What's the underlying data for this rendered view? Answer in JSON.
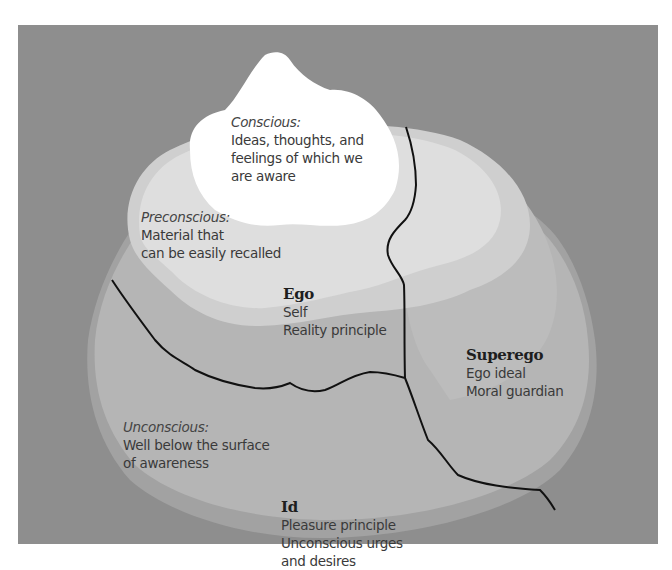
{
  "diagram": {
    "type": "iceberg model of the mind",
    "colors": {
      "background_frame": "#8e8e8e",
      "unconscious_region": "#b4b4b4",
      "unconscious_rim": "#a2a2a2",
      "preconscious_region": "#d6d6d6",
      "preconscious_inner": "#e2e2e2",
      "conscious_tip": "#ffffff",
      "divider_lines": "#111111",
      "text": "#3a3a3a"
    },
    "levels": {
      "conscious": {
        "title": "Conscious:",
        "lines": [
          "Ideas, thoughts, and",
          "feelings of which we",
          "are aware"
        ]
      },
      "preconscious": {
        "title": "Preconscious:",
        "lines": [
          "Material that",
          "can be easily recalled"
        ]
      },
      "unconscious": {
        "title": "Unconscious:",
        "lines": [
          "Well below the surface",
          "of awareness"
        ]
      }
    },
    "structures": {
      "ego": {
        "title": "Ego",
        "lines": [
          "Self",
          "Reality principle"
        ]
      },
      "superego": {
        "title": "Superego",
        "lines": [
          "Ego ideal",
          "Moral guardian"
        ]
      },
      "id": {
        "title": "Id",
        "lines": [
          "Pleasure principle",
          "Unconscious urges",
          "and desires"
        ]
      }
    }
  }
}
